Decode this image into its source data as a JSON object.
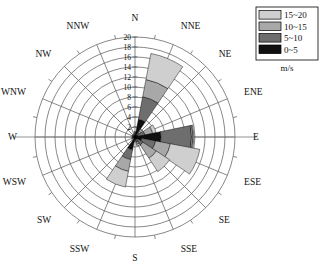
{
  "chart_data": {
    "type": "bar",
    "subtype": "wind-rose",
    "title": "",
    "xlabel": "",
    "ylabel": "",
    "unit_label": "m/s",
    "rlim": [
      0,
      20
    ],
    "r_ticks": [
      2,
      4,
      6,
      8,
      10,
      12,
      14,
      16,
      18,
      20
    ],
    "r_tick_labels": [
      "2",
      "4",
      "6",
      "8",
      "10",
      "12",
      "14",
      "16",
      "18",
      "20"
    ],
    "grid": true,
    "legend_position": "top-right",
    "categories": [
      "N",
      "NNE",
      "NE",
      "ENE",
      "E",
      "ESE",
      "SE",
      "SSE",
      "S",
      "SSW",
      "SW",
      "WSW",
      "W",
      "WNW",
      "NW",
      "NNW"
    ],
    "series": [
      {
        "name": "0~5",
        "color": "#101010",
        "values": [
          0.4,
          3.6,
          0.5,
          0.6,
          5.2,
          1.4,
          0.6,
          0.5,
          0.3,
          2.6,
          0.2,
          0.2,
          0.2,
          0.2,
          0.2,
          0.2
        ]
      },
      {
        "name": "5~10",
        "color": "#6e6e6e",
        "values": [
          0.3,
          4.6,
          0.6,
          1.4,
          6.1,
          2.8,
          1.3,
          0.6,
          0.3,
          2.0,
          0.2,
          0.2,
          0.2,
          0.2,
          0.2,
          0.2
        ]
      },
      {
        "name": "10~15",
        "color": "#a8a8a8",
        "values": [
          0.2,
          3.5,
          0.4,
          1.6,
          0.3,
          3.0,
          3.2,
          0.4,
          0.2,
          2.4,
          0.2,
          0.1,
          0.1,
          0.1,
          0.1,
          0.1
        ]
      },
      {
        "name": "15~20",
        "color": "#cfcfcf",
        "values": [
          0.2,
          5.3,
          0.3,
          0.7,
          0.2,
          6.0,
          3.2,
          0.3,
          0.2,
          3.2,
          0.2,
          0.1,
          0.1,
          0.1,
          0.1,
          0.1
        ]
      }
    ],
    "totals": [
      1.1,
      17.0,
      1.8,
      4.3,
      11.8,
      13.2,
      8.3,
      1.8,
      1.0,
      10.2,
      0.8,
      0.6,
      0.6,
      0.6,
      0.6,
      0.6
    ]
  },
  "legend": {
    "unit": "m/s",
    "entries": [
      {
        "label": "15~20",
        "color": "#cfcfcf"
      },
      {
        "label": "10~15",
        "color": "#a8a8a8"
      },
      {
        "label": "5~10",
        "color": "#6e6e6e"
      },
      {
        "label": "0~5",
        "color": "#101010"
      }
    ]
  },
  "compass": {
    "labels": [
      "N",
      "NNE",
      "NE",
      "ENE",
      "E",
      "ESE",
      "SE",
      "SSE",
      "S",
      "SSW",
      "SW",
      "WSW",
      "W",
      "WNW",
      "NW",
      "NNW"
    ]
  }
}
